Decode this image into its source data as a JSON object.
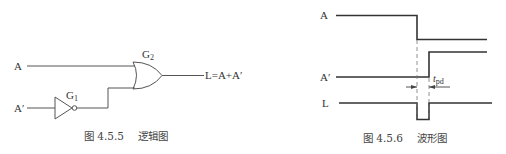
{
  "logic_diagram": {
    "inputs": {
      "a": "A",
      "a_prime": "A′"
    },
    "gates": {
      "g1": {
        "label_main": "G",
        "label_sub": "1",
        "type": "NOT"
      },
      "g2": {
        "label_main": "G",
        "label_sub": "2",
        "type": "OR"
      }
    },
    "output": "L=A+A′",
    "caption_num": "图 4.5.5",
    "caption_text": "逻辑图"
  },
  "waveform_diagram": {
    "signals": [
      {
        "name": "A",
        "description": "high then falls to low"
      },
      {
        "name": "A′",
        "description": "low then rises to high after delay"
      },
      {
        "name": "L",
        "description": "high with a short low glitch of width t_pd"
      }
    ],
    "delay_label_main": "t",
    "delay_label_sub": "pd",
    "caption_num": "图 4.5.6",
    "caption_text": "波形图"
  }
}
